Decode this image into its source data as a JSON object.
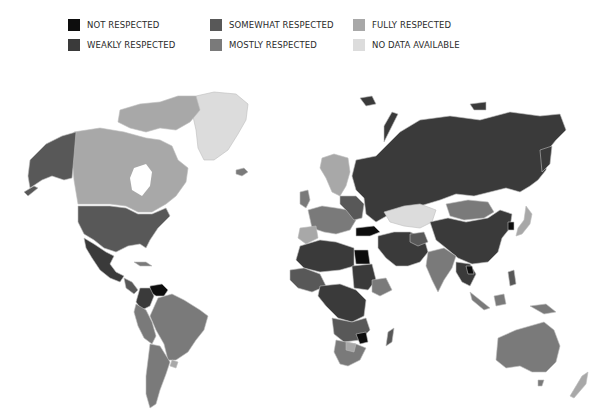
{
  "legend": {
    "items": [
      {
        "label": "NOT RESPECTED",
        "color": "#0d0d0d"
      },
      {
        "label": "WEAKLY RESPECTED",
        "color": "#3a3a3a"
      },
      {
        "label": "SOMEWHAT RESPECTED",
        "color": "#585858"
      },
      {
        "label": "MOSTLY RESPECTED",
        "color": "#7a7a7a"
      },
      {
        "label": "FULLY RESPECTED",
        "color": "#a8a8a8"
      },
      {
        "label": "NO DATA AVAILABLE",
        "color": "#dcdcdc"
      }
    ]
  },
  "map": {
    "title": "World map of rights respect levels",
    "regions": [
      {
        "name": "Alaska (USA)",
        "category": "MOSTLY RESPECTED"
      },
      {
        "name": "Canada",
        "category": "FULLY RESPECTED"
      },
      {
        "name": "Greenland",
        "category": "NO DATA AVAILABLE"
      },
      {
        "name": "United States",
        "category": "MOSTLY RESPECTED"
      },
      {
        "name": "Mexico",
        "category": "SOMEWHAT RESPECTED"
      },
      {
        "name": "Venezuela",
        "category": "NOT RESPECTED"
      },
      {
        "name": "Colombia",
        "category": "SOMEWHAT RESPECTED"
      },
      {
        "name": "Brazil",
        "category": "MOSTLY RESPECTED"
      },
      {
        "name": "Argentina",
        "category": "MOSTLY RESPECTED"
      },
      {
        "name": "Uruguay",
        "category": "FULLY RESPECTED"
      },
      {
        "name": "Nordic countries",
        "category": "FULLY RESPECTED"
      },
      {
        "name": "Western Europe",
        "category": "MOSTLY RESPECTED"
      },
      {
        "name": "Russia",
        "category": "WEAKLY RESPECTED"
      },
      {
        "name": "Kazakhstan",
        "category": "NO DATA AVAILABLE"
      },
      {
        "name": "Mongolia",
        "category": "MOSTLY RESPECTED"
      },
      {
        "name": "China",
        "category": "WEAKLY RESPECTED"
      },
      {
        "name": "Japan",
        "category": "FULLY RESPECTED"
      },
      {
        "name": "Turkey",
        "category": "NOT RESPECTED"
      },
      {
        "name": "Egypt",
        "category": "NOT RESPECTED"
      },
      {
        "name": "Middle East",
        "category": "WEAKLY RESPECTED"
      },
      {
        "name": "India",
        "category": "MOSTLY RESPECTED"
      },
      {
        "name": "North Africa",
        "category": "WEAKLY RESPECTED"
      },
      {
        "name": "Central Africa",
        "category": "WEAKLY RESPECTED"
      },
      {
        "name": "Zimbabwe",
        "category": "NOT RESPECTED"
      },
      {
        "name": "Southern Africa",
        "category": "MOSTLY RESPECTED"
      },
      {
        "name": "Madagascar",
        "category": "SOMEWHAT RESPECTED"
      },
      {
        "name": "Southeast Asia",
        "category": "WEAKLY RESPECTED"
      },
      {
        "name": "Indonesia",
        "category": "MOSTLY RESPECTED"
      },
      {
        "name": "Australia",
        "category": "MOSTLY RESPECTED"
      },
      {
        "name": "New Zealand",
        "category": "FULLY RESPECTED"
      }
    ]
  }
}
